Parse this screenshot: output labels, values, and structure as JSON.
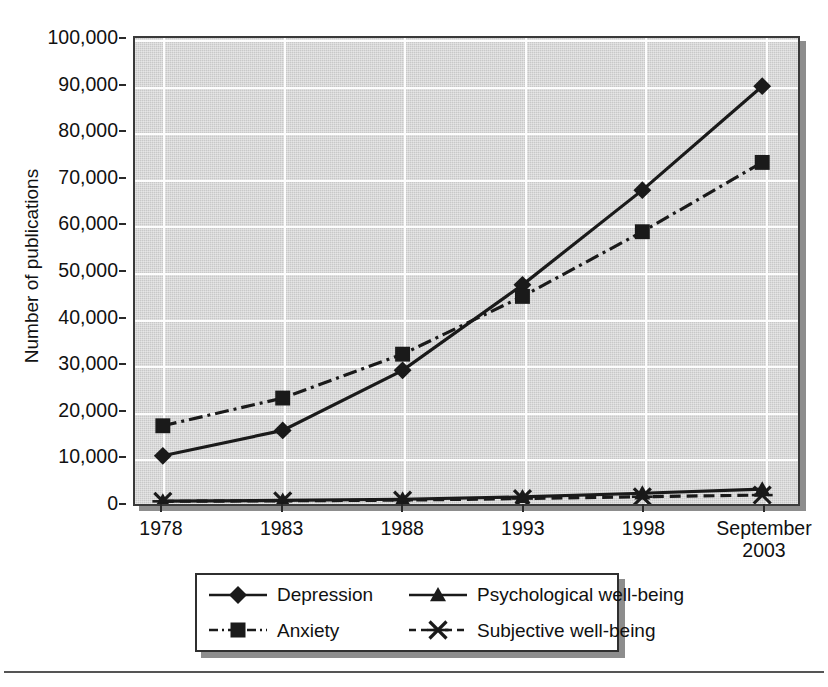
{
  "chart_data": {
    "type": "line",
    "title": "",
    "xlabel": "Year",
    "ylabel": "Number of publications",
    "categories": [
      "1978",
      "1983",
      "1988",
      "1993",
      "1998",
      "September\n2003"
    ],
    "x_tick_labels": [
      "1978",
      "1983",
      "1988",
      "1993",
      "1998",
      "September\n2003"
    ],
    "y_tick_labels": [
      "0",
      "10,000",
      "20,000",
      "30,000",
      "40,000",
      "50,000",
      "60,000",
      "70,000",
      "80,000",
      "90,000",
      "100,000"
    ],
    "y_tick_values": [
      0,
      10000,
      20000,
      30000,
      40000,
      50000,
      60000,
      70000,
      80000,
      90000,
      100000
    ],
    "ylim": [
      0,
      100000
    ],
    "grid": true,
    "legend_position": "below-plot",
    "plot_background": "#c8c8c8",
    "gridline_color": "#ffffff",
    "series": [
      {
        "name": "Depression",
        "marker": "diamond",
        "line_style": "solid",
        "color": "#1a1a1a",
        "values": [
          10000,
          15500,
          28500,
          47000,
          67500,
          90000
        ]
      },
      {
        "name": "Anxiety",
        "marker": "square",
        "line_style": "dash-dot",
        "color": "#1a1a1a",
        "values": [
          16500,
          22500,
          32000,
          44500,
          58500,
          73500
        ]
      },
      {
        "name": "Psychological well-being",
        "marker": "triangle",
        "line_style": "solid",
        "color": "#1a1a1a",
        "values": [
          200,
          350,
          600,
          1100,
          1900,
          2800
        ]
      },
      {
        "name": "Subjective well-being",
        "marker": "x-cross",
        "line_style": "dashed",
        "color": "#1a1a1a",
        "values": [
          150,
          250,
          400,
          750,
          1150,
          1500
        ]
      }
    ]
  },
  "legend": {
    "items": [
      {
        "label": "Depression",
        "key": "diamond-solid-key"
      },
      {
        "label": "Psychological well-being",
        "key": "triangle-solid-key"
      },
      {
        "label": "Anxiety",
        "key": "square-dashdot-key"
      },
      {
        "label": "Subjective well-being",
        "key": "xcross-dashed-key"
      }
    ]
  }
}
